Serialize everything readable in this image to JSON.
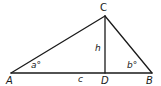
{
  "diagram": {
    "type": "triangle-with-altitude",
    "stroke_color": "#1a1a1a",
    "vertices": {
      "A": {
        "label": "A",
        "x": 11,
        "y": 73
      },
      "B": {
        "label": "B",
        "x": 152,
        "y": 73
      },
      "C": {
        "label": "C",
        "x": 105,
        "y": 16
      },
      "D": {
        "label": "D",
        "x": 105,
        "y": 73
      }
    },
    "labels": {
      "A": "A",
      "B": "B",
      "C": "C",
      "D": "D",
      "side_c": "c",
      "altitude": "h",
      "angle_a": "a°",
      "angle_b": "b°"
    },
    "edges": [
      {
        "from": "A",
        "to": "B",
        "name": "side-c"
      },
      {
        "from": "A",
        "to": "C",
        "name": "side-b"
      },
      {
        "from": "B",
        "to": "C",
        "name": "side-a"
      },
      {
        "from": "C",
        "to": "D",
        "name": "altitude-h"
      }
    ]
  }
}
